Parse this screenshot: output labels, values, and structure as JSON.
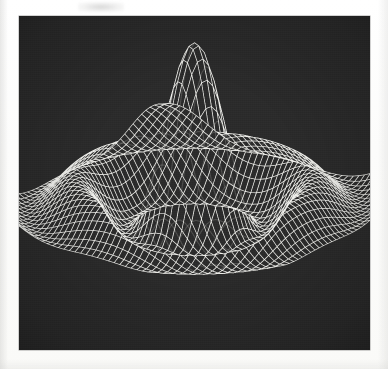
{
  "figure": {
    "title": "3D wireframe mesh surface plot",
    "caption": "",
    "media": "scanned halftone print",
    "background_color": "#2b2b2b",
    "mesh_color": "#f2f2ee",
    "paper_color": "#fdfdfc",
    "plot_rect": {
      "x": 19,
      "y": 16,
      "width": 351,
      "height": 334
    }
  },
  "chart_data": {
    "type": "surface",
    "title": "",
    "subtitle": "",
    "xlabel": "",
    "ylabel": "",
    "zlabel": "",
    "grid": false,
    "legend": "none",
    "render_style": "wireframe-mesh",
    "line_color": "#f2f2ee",
    "face_color": "#2b2b2b",
    "projection": "oblique-parallel",
    "view": {
      "azimuth_deg": 37,
      "elevation_deg": 22,
      "roll_deg": 0
    },
    "function": "z = sin(r) / r  (radially symmetric sinc / jinc surface)",
    "grid_n": 46,
    "xlim": [
      -10.5,
      10.5
    ],
    "ylim": [
      -10.5,
      10.5
    ],
    "zlim": [
      -0.28,
      1.0
    ],
    "x_ticks": [],
    "y_ticks": [],
    "z_ticks": [],
    "annotations": [],
    "features": {
      "central_peak": {
        "height_norm": 1.0,
        "screen_x_frac": 0.56,
        "screen_y_frac": 0.03
      },
      "side_lobes_up": 4,
      "side_lobes_down": 2,
      "ring_count": 3,
      "saddle_center": {
        "screen_x_frac": 0.47,
        "screen_y_frac": 0.52
      }
    },
    "peaks_screen": [
      {
        "label": "left-outer-lobe",
        "x_frac": 0.09,
        "y_frac": 0.16,
        "relative_height": 0.42
      },
      {
        "label": "left-inner-lobe",
        "x_frac": 0.31,
        "y_frac": 0.11,
        "relative_height": 0.52
      },
      {
        "label": "central-peak",
        "x_frac": 0.56,
        "y_frac": 0.02,
        "relative_height": 1.0
      },
      {
        "label": "right-inner-lobe",
        "x_frac": 0.81,
        "y_frac": 0.17,
        "relative_height": 0.45
      },
      {
        "label": "right-outer-lobe",
        "x_frac": 0.94,
        "y_frac": 0.21,
        "relative_height": 0.38
      }
    ],
    "troughs_screen": [
      {
        "label": "bottom-central-valley",
        "x_frac": 0.56,
        "y_frac": 0.99,
        "relative_depth": -0.28
      },
      {
        "label": "left-valley",
        "x_frac": 0.26,
        "y_frac": 0.88,
        "relative_depth": -0.18
      },
      {
        "label": "right-valley",
        "x_frac": 0.78,
        "y_frac": 0.9,
        "relative_depth": -0.18
      }
    ]
  },
  "render": {
    "amplitude": 1.0,
    "frequency": 1.0,
    "mesh_line_width": 0.65,
    "mesh_opacity": 0.95,
    "scale_x": 1.0,
    "scale_z": 1.0
  }
}
